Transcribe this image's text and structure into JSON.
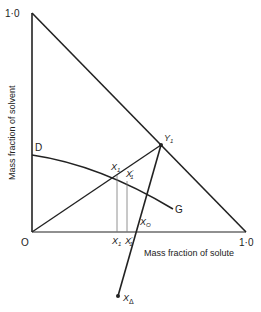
{
  "diagram": {
    "type": "ternary extraction diagram (right-angled triangle)",
    "axes": {
      "y_label": "Mass fraction of solvent",
      "x_label": "Mass fraction of solute",
      "origin_label": "O",
      "y_max_label": "1·0",
      "x_max_label": "1·0"
    },
    "points": {
      "D": "D",
      "G": "G",
      "Y1": "Y",
      "Y1_sub": "1",
      "X1": "X",
      "X1_sub": "1",
      "X1p": "X",
      "X1p_sub": "1",
      "X1p_sup": "'",
      "X0": "X",
      "X0_sub": "O",
      "Xdelta": "X",
      "Xdelta_sub": "Δ",
      "X1_axis": "X",
      "X1_axis_sub": "1",
      "X1p_axis": "X",
      "X1p_axis_sub": "1",
      "X1p_axis_sup": "'"
    },
    "colors": {
      "line": "#222222",
      "thin_line": "#777777"
    }
  }
}
